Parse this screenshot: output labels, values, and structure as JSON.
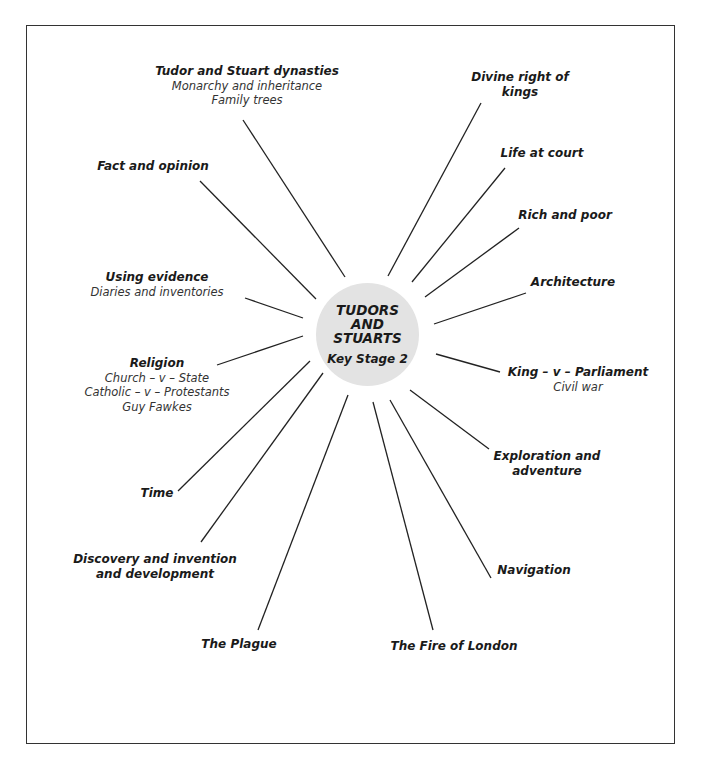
{
  "hub": {
    "title_lines": [
      "TUDORS",
      "AND",
      "STUARTS"
    ],
    "subtitle": "Key Stage 2",
    "fill_color": "#e3e3e3"
  },
  "topics": [
    {
      "heading": "Tudor and Stuart dynasties",
      "lines": [
        "Monarchy and inheritance",
        "Family trees"
      ]
    },
    {
      "heading": "Fact and opinion",
      "lines": []
    },
    {
      "heading": "Using evidence",
      "lines": [
        "Diaries and inventories"
      ]
    },
    {
      "heading": "Religion",
      "lines": [
        "Church – v – State",
        "Catholic – v – Protestants",
        "Guy Fawkes"
      ]
    },
    {
      "heading": "Time",
      "lines": []
    },
    {
      "heading": "Discovery and invention and development",
      "lines": []
    },
    {
      "heading": "The Plague",
      "lines": []
    },
    {
      "heading": "The Fire of London",
      "lines": []
    },
    {
      "heading": "Navigation",
      "lines": []
    },
    {
      "heading": "Exploration and adventure",
      "lines": []
    },
    {
      "heading": "King – v – Parliament",
      "lines": [
        "Civil war"
      ]
    },
    {
      "heading": "Architecture",
      "lines": []
    },
    {
      "heading": "Rich and poor",
      "lines": []
    },
    {
      "heading": "Life at court",
      "lines": []
    },
    {
      "heading": "Divine right of kings",
      "lines": []
    }
  ]
}
